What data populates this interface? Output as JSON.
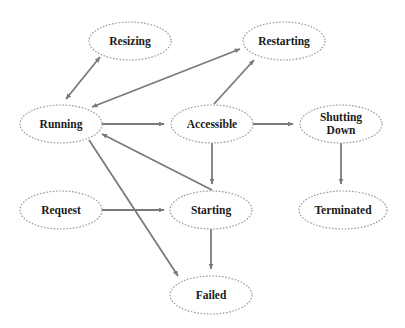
{
  "diagram": {
    "title": "",
    "colors": {
      "background": "#ffffff",
      "node_border": "#9a9a9a",
      "node_fill": "#ffffff",
      "edge": "#7a7a7a",
      "text": "#1a1a1a"
    },
    "nodes": [
      {
        "id": "resizing",
        "label": "Resizing",
        "lines": [
          "Resizing"
        ],
        "cx": 130,
        "cy": 41,
        "rx": 41,
        "ry": 19
      },
      {
        "id": "restarting",
        "label": "Restarting",
        "lines": [
          "Restarting"
        ],
        "cx": 284,
        "cy": 41,
        "rx": 41,
        "ry": 19
      },
      {
        "id": "running",
        "label": "Running",
        "lines": [
          "Running"
        ],
        "cx": 61,
        "cy": 124,
        "rx": 41,
        "ry": 19
      },
      {
        "id": "accessible",
        "label": "Accessible",
        "lines": [
          "Accessible"
        ],
        "cx": 212,
        "cy": 124,
        "rx": 41,
        "ry": 19
      },
      {
        "id": "shutting-down",
        "label": "Shutting Down",
        "lines": [
          "Shutting",
          "Down"
        ],
        "cx": 341,
        "cy": 124,
        "rx": 41,
        "ry": 19
      },
      {
        "id": "request",
        "label": "Request",
        "lines": [
          "Request"
        ],
        "cx": 61,
        "cy": 210,
        "rx": 41,
        "ry": 19
      },
      {
        "id": "starting",
        "label": "Starting",
        "lines": [
          "Starting"
        ],
        "cx": 211,
        "cy": 210,
        "rx": 41,
        "ry": 19
      },
      {
        "id": "terminated",
        "label": "Terminated",
        "lines": [
          "Terminated"
        ],
        "cx": 343,
        "cy": 210,
        "rx": 44,
        "ry": 19
      },
      {
        "id": "failed",
        "label": "Failed",
        "lines": [
          "Failed"
        ],
        "cx": 211,
        "cy": 295,
        "rx": 41,
        "ry": 19
      }
    ],
    "edges": [
      {
        "from": "running",
        "to": "resizing",
        "bidirectional": true,
        "x1": 66,
        "y1": 99,
        "x2": 100,
        "y2": 57
      },
      {
        "from": "running",
        "to": "restarting",
        "bidirectional": true,
        "x1": 92,
        "y1": 107,
        "x2": 240,
        "y2": 49
      },
      {
        "from": "running",
        "to": "accessible",
        "bidirectional": false,
        "x1": 101,
        "y1": 124,
        "x2": 164,
        "y2": 124
      },
      {
        "from": "accessible",
        "to": "restarting",
        "bidirectional": false,
        "x1": 214,
        "y1": 104,
        "x2": 254,
        "y2": 60
      },
      {
        "from": "accessible",
        "to": "shutting-down",
        "bidirectional": false,
        "x1": 253,
        "y1": 124,
        "x2": 293,
        "y2": 124
      },
      {
        "from": "accessible",
        "to": "starting",
        "bidirectional": false,
        "x1": 212,
        "y1": 143,
        "x2": 212,
        "y2": 184
      },
      {
        "from": "starting",
        "to": "running",
        "bidirectional": false,
        "x1": 212,
        "y1": 190,
        "x2": 102,
        "y2": 134
      },
      {
        "from": "running",
        "to": "failed",
        "bidirectional": false,
        "x1": 89,
        "y1": 140,
        "x2": 178,
        "y2": 276
      },
      {
        "from": "request",
        "to": "starting",
        "bidirectional": false,
        "x1": 101,
        "y1": 210,
        "x2": 164,
        "y2": 210
      },
      {
        "from": "starting",
        "to": "failed",
        "bidirectional": false,
        "x1": 211,
        "y1": 229,
        "x2": 211,
        "y2": 269
      },
      {
        "from": "shutting-down",
        "to": "terminated",
        "bidirectional": false,
        "x1": 341,
        "y1": 143,
        "x2": 341,
        "y2": 184
      }
    ]
  }
}
